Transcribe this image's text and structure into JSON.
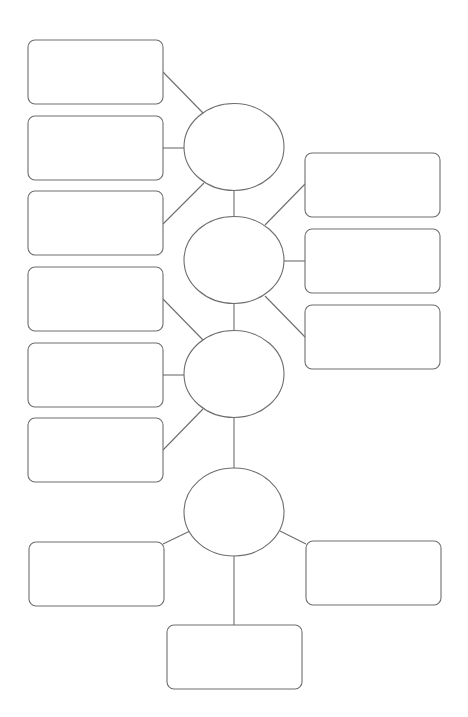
{
  "diagram": {
    "title": "",
    "type": "graphic-organizer",
    "stroke_color": "#6e6e6e",
    "background_color": "#ffffff",
    "hubs": [
      {
        "id": "hub-1",
        "label": ""
      },
      {
        "id": "hub-2",
        "label": ""
      },
      {
        "id": "hub-3",
        "label": ""
      },
      {
        "id": "hub-4",
        "label": ""
      }
    ],
    "boxes": [
      {
        "id": "box-left-1",
        "hub": "hub-1",
        "label": ""
      },
      {
        "id": "box-left-2",
        "hub": "hub-1",
        "label": ""
      },
      {
        "id": "box-left-3",
        "hub": "hub-1",
        "label": ""
      },
      {
        "id": "box-right-1",
        "hub": "hub-2",
        "label": ""
      },
      {
        "id": "box-right-2",
        "hub": "hub-2",
        "label": ""
      },
      {
        "id": "box-right-3",
        "hub": "hub-2",
        "label": ""
      },
      {
        "id": "box-left-4",
        "hub": "hub-3",
        "label": ""
      },
      {
        "id": "box-left-5",
        "hub": "hub-3",
        "label": ""
      },
      {
        "id": "box-left-6",
        "hub": "hub-3",
        "label": ""
      },
      {
        "id": "box-bottom-left",
        "hub": "hub-4",
        "label": ""
      },
      {
        "id": "box-bottom-right",
        "hub": "hub-4",
        "label": ""
      },
      {
        "id": "box-bottom-center",
        "hub": "hub-4",
        "label": ""
      }
    ],
    "hub_links": [
      [
        "hub-1",
        "hub-2"
      ],
      [
        "hub-2",
        "hub-3"
      ],
      [
        "hub-3",
        "hub-4"
      ]
    ]
  }
}
